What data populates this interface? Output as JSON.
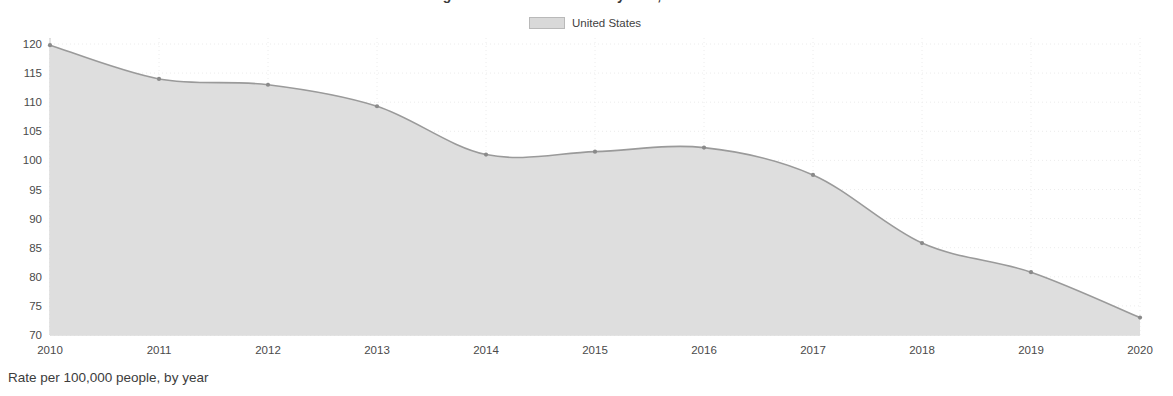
{
  "chart_data": {
    "type": "area",
    "title": "Drug Overdose Death Rates by Year, United States",
    "legend": [
      {
        "name": "United States",
        "color": "#d9d9d9"
      }
    ],
    "legend_position": "top-center",
    "x": [
      2010,
      2011,
      2012,
      2013,
      2014,
      2015,
      2016,
      2017,
      2018,
      2019,
      2020
    ],
    "series": [
      {
        "name": "United States",
        "values": [
          119.8,
          114.0,
          113.0,
          109.3,
          101.0,
          101.5,
          102.2,
          97.5,
          85.8,
          80.8,
          73.0
        ]
      }
    ],
    "categories": [
      "2010",
      "2011",
      "2012",
      "2013",
      "2014",
      "2015",
      "2016",
      "2017",
      "2018",
      "2019",
      "2020"
    ],
    "xlabel": "",
    "ylabel": "",
    "xlim": [
      2010,
      2020
    ],
    "ylim": [
      70,
      120
    ],
    "y_ticks": [
      120,
      115,
      110,
      105,
      100,
      95,
      90,
      85,
      80,
      75,
      70
    ],
    "x_ticks": [
      "2010",
      "2011",
      "2012",
      "2013",
      "2014",
      "2015",
      "2016",
      "2017",
      "2018",
      "2019",
      "2020"
    ],
    "grid": true,
    "grid_style": "dotted",
    "caption": "Rate per 100,000 people, by year",
    "colors": {
      "area_fill": "#dedede",
      "line_stroke": "#9a9a9a",
      "marker": "#8a8a8a",
      "grid": "#ececec",
      "axis": "#c9c9c9",
      "text": "#4a4a4a"
    }
  }
}
